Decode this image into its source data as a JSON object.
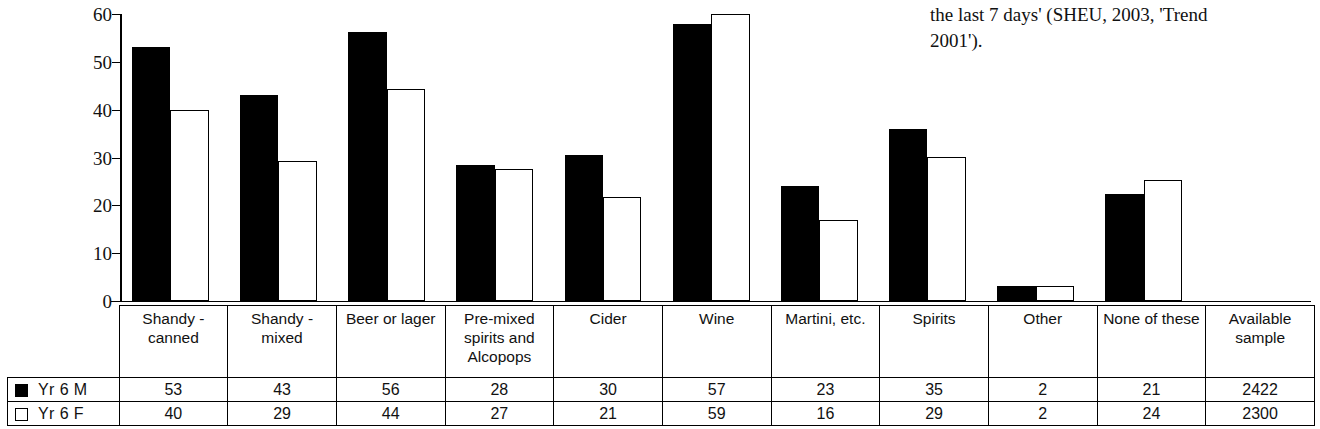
{
  "body_text": {
    "line1": "the last 7 days' (SHEU, 2003, 'Trend",
    "line2": "2001')."
  },
  "legend": {
    "series": [
      {
        "key": "m",
        "label": "Yr 6 M",
        "swatch": "filled-square-icon",
        "color": "#000000"
      },
      {
        "key": "f",
        "label": "Yr 6 F",
        "swatch": "hollow-square-icon",
        "color": "#ffffff"
      }
    ]
  },
  "chart_data": {
    "type": "bar",
    "title": "",
    "xlabel": "",
    "ylabel": "",
    "ylim": [
      0,
      60
    ],
    "yticks": [
      0,
      10,
      20,
      30,
      40,
      50,
      60
    ],
    "grid": false,
    "legend_position": "table-left",
    "categories": [
      "Shandy - canned",
      "Shandy - mixed",
      "Beer or lager",
      "Pre-mixed spirits and Alcopops",
      "Cider",
      "Wine",
      "Martini, etc.",
      "Spirits",
      "Other",
      "None of these",
      "Available sample"
    ],
    "category_lines": [
      [
        "Shandy -",
        "canned"
      ],
      [
        "Shandy -",
        "mixed"
      ],
      [
        "Beer or lager"
      ],
      [
        "Pre-mixed",
        "spirits and",
        "Alcopops"
      ],
      [
        "Cider"
      ],
      [
        "Wine"
      ],
      [
        "Martini, etc."
      ],
      [
        "Spirits"
      ],
      [
        "Other"
      ],
      [
        "None of these"
      ],
      [
        "Available",
        "sample"
      ]
    ],
    "series": [
      {
        "name": "Yr 6 M",
        "values": [
          53,
          43,
          56,
          28,
          30,
          57,
          23,
          35,
          2,
          21,
          2422
        ],
        "plotted": [
          53,
          43,
          56.3,
          28.5,
          30.6,
          58,
          24,
          36,
          3.2,
          22.4,
          null
        ]
      },
      {
        "name": "Yr 6 F",
        "values": [
          40,
          29,
          44,
          27,
          21,
          59,
          16,
          29,
          2,
          24,
          2300
        ],
        "plotted": [
          40,
          29.3,
          44.4,
          27.5,
          21.7,
          60,
          17,
          30.2,
          3.2,
          25.4,
          null
        ]
      }
    ],
    "note": "Last column 'Available sample' lists sample sizes and is not plotted as bars."
  }
}
